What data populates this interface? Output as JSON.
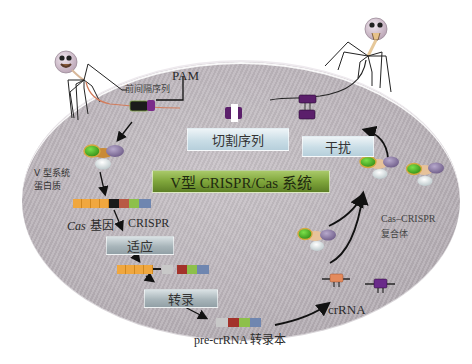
{
  "diagram": {
    "title": "V型 CRISPR/Cas 系统",
    "stages": {
      "adaptation": "适应",
      "transcription": "转录",
      "cleavage_sequence": "切割序列",
      "interference": "干扰"
    },
    "labels": {
      "pam": "PAM",
      "protospacer": "前间隔序列",
      "type_v_protein_line1": "V 型系统",
      "type_v_protein_line2": "蛋白质",
      "cas_gene_italic": "Cas",
      "cas_gene_suffix": " 基因",
      "crispr": "CRISPR",
      "pre_crrna": "pre-crRNA 转录本",
      "crrna": "crRNA",
      "complex_line1": "Cas–CRISPR",
      "complex_line2": "复合体"
    },
    "colors": {
      "cell": "#bcb5bb",
      "cas_gene": "#f0a73f",
      "leader": "#1a1a1a",
      "repeat_grey": "#c8c8c8",
      "spacer_red": "#a3322a",
      "spacer_green": "#8dc04a",
      "spacer_blue": "#6f86b0",
      "protein_green": "#4bb02a",
      "protein_purple": "#8a79a0",
      "protein_white": "#eef2f2",
      "dna_purple": "#5b1f6b",
      "crrna_orange": "#e48a5c"
    }
  }
}
